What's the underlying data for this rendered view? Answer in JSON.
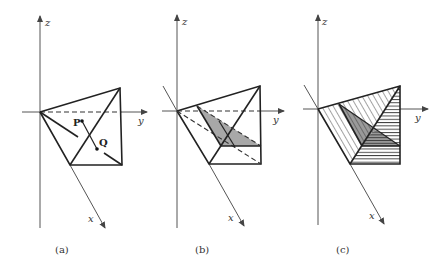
{
  "figure": {
    "panels": [
      {
        "id": "a",
        "caption": "(a)",
        "axes": {
          "x": "x",
          "y": "y",
          "z": "z"
        },
        "points": {
          "P": "P",
          "Q": "Q"
        }
      },
      {
        "id": "b",
        "caption": "(b)",
        "axes": {
          "x": "x",
          "y": "y",
          "z": "z"
        }
      },
      {
        "id": "c",
        "caption": "(c)",
        "axes": {
          "x": "x",
          "y": "y",
          "z": "z"
        }
      }
    ],
    "colors": {
      "shade": "#a8a8a8",
      "shade_dark": "#8a8a8a",
      "line": "#222222",
      "axis": "#555555"
    }
  }
}
